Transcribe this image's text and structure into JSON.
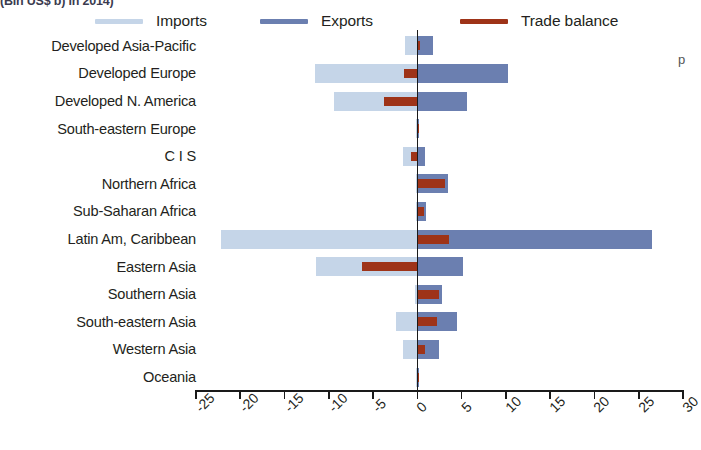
{
  "title_clipped": "(Bln US$ b) in 2014)",
  "right_margin_text": "p",
  "legend": {
    "position": "top",
    "items": [
      {
        "label": "Imports",
        "color": "#c5d5e8",
        "name": "legend-imports"
      },
      {
        "label": "Exports",
        "color": "#6b7fb0",
        "name": "legend-exports"
      },
      {
        "label": "Trade balance",
        "color": "#9e3318",
        "name": "legend-trade-balance"
      }
    ]
  },
  "chart_data": {
    "type": "bar",
    "orientation": "horizontal",
    "title": "(Bln US$ b) in 2014)",
    "xlabel": "",
    "ylabel": "",
    "xlim": [
      -25,
      30
    ],
    "xticks": [
      -25,
      -20,
      -15,
      -10,
      -5,
      0,
      5,
      10,
      15,
      20,
      25,
      30
    ],
    "xtick_labels": [
      "-25",
      "-20",
      "-15",
      "-10",
      "-5",
      "0",
      "5",
      "10",
      "15",
      "20",
      "25",
      "30"
    ],
    "grid": false,
    "legend_position": "top",
    "categories": [
      "Developed Asia-Pacific",
      "Developed Europe",
      "Developed N. America",
      "South-eastern Europe",
      "C I S",
      "Northern Africa",
      "Sub-Saharan Africa",
      "Latin Am, Caribbean",
      "Eastern Asia",
      "Southern Asia",
      "South-eastern Asia",
      "Western Asia",
      "Oceania"
    ],
    "series": [
      {
        "name": "Imports",
        "color": "#c5d5e8",
        "values": [
          -1.4,
          -11.6,
          -9.4,
          -0.2,
          -1.6,
          -0.1,
          -0.2,
          -22.2,
          -11.5,
          -0.3,
          -2.4,
          -1.6,
          -0.1
        ]
      },
      {
        "name": "Exports",
        "color": "#6b7fb0",
        "values": [
          1.8,
          10.2,
          5.6,
          0.2,
          0.9,
          3.5,
          1.0,
          26.5,
          5.2,
          2.8,
          4.5,
          2.4,
          0.1
        ]
      },
      {
        "name": "Trade balance",
        "color": "#9e3318",
        "values": [
          0.3,
          -1.5,
          -3.8,
          0.05,
          -0.7,
          3.1,
          0.7,
          3.6,
          -6.2,
          2.4,
          2.2,
          0.9,
          0.02
        ]
      }
    ]
  }
}
